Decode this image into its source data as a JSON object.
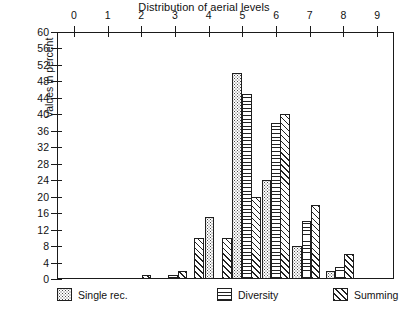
{
  "chart_data": {
    "type": "bar",
    "title": "Distribution of aerial levels",
    "xlabel": "",
    "ylabel": "Values in percent",
    "xlim": [
      -0.5,
      9.5
    ],
    "ylim": [
      0,
      60
    ],
    "x_ticks": [
      0,
      1,
      2,
      3,
      4,
      5,
      6,
      7,
      8,
      9
    ],
    "y_ticks": [
      0,
      4,
      8,
      12,
      16,
      20,
      24,
      28,
      32,
      36,
      40,
      44,
      48,
      52,
      56,
      60
    ],
    "grid": false,
    "x_axis_position": "top",
    "legend_position": "bottom",
    "categories": [
      2,
      3,
      4,
      5,
      6,
      7,
      8
    ],
    "series": [
      {
        "name": "Single rec.",
        "pattern": "dotted",
        "values": [
          0,
          0,
          10,
          50,
          24,
          8,
          2
        ]
      },
      {
        "name": "Diversity",
        "pattern": "horizontal-lines",
        "values": [
          0,
          1,
          10,
          45,
          38,
          14,
          3
        ]
      },
      {
        "name": "Summing",
        "pattern": "diagonal-hatch",
        "values": [
          1,
          2,
          15,
          20,
          40,
          18,
          6
        ]
      }
    ],
    "bars": [
      {
        "series": "Summing",
        "x": 2.15,
        "value": 1
      },
      {
        "series": "Diversity",
        "x": 2.95,
        "value": 1
      },
      {
        "series": "Summing",
        "x": 3.22,
        "value": 2
      },
      {
        "series": "Summing",
        "x": 3.72,
        "value": 10
      },
      {
        "series": "Single rec.",
        "x": 4.02,
        "value": 15
      },
      {
        "series": "Summing",
        "x": 4.55,
        "value": 10
      },
      {
        "series": "Single rec.",
        "x": 4.85,
        "value": 50
      },
      {
        "series": "Diversity",
        "x": 5.13,
        "value": 45
      },
      {
        "series": "Summing",
        "x": 5.4,
        "value": 20
      },
      {
        "series": "Single rec.",
        "x": 5.72,
        "value": 24
      },
      {
        "series": "Diversity",
        "x": 6.0,
        "value": 38
      },
      {
        "series": "Summing",
        "x": 6.27,
        "value": 40
      },
      {
        "series": "Single rec.",
        "x": 6.62,
        "value": 8
      },
      {
        "series": "Diversity",
        "x": 6.9,
        "value": 14
      },
      {
        "series": "Summing",
        "x": 7.17,
        "value": 18
      },
      {
        "series": "Single rec.",
        "x": 7.62,
        "value": 2
      },
      {
        "series": "Diversity",
        "x": 7.89,
        "value": 3
      },
      {
        "series": "Summing",
        "x": 8.16,
        "value": 6
      }
    ]
  },
  "legend": {
    "items": [
      {
        "label": "Single rec.",
        "pattern": "dotted"
      },
      {
        "label": "Diversity",
        "pattern": "horizontal-lines"
      },
      {
        "label": "Summing",
        "pattern": "diagonal-hatch"
      }
    ]
  }
}
